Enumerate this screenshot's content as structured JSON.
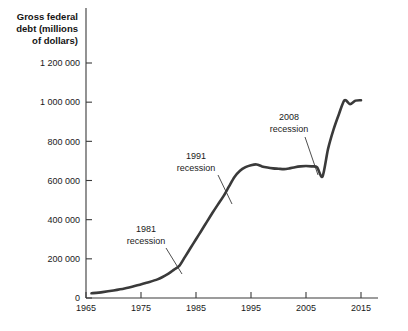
{
  "chart_data": {
    "type": "line",
    "title": "",
    "ylabel": "Gross federal debt (millions of dollars)",
    "ylabel_lines": [
      "Gross federal",
      "debt (millions",
      "of dollars)"
    ],
    "xlabel": "",
    "xlim": [
      1965,
      2015
    ],
    "ylim": [
      0,
      1300000
    ],
    "grid": false,
    "legend": null,
    "line_color": "#3a3a3a",
    "axis_color": "#3a3a3a",
    "background_color": "#ffffff",
    "y_ticks": [
      0,
      200000,
      400000,
      600000,
      800000,
      1000000,
      1200000
    ],
    "y_tick_labels": [
      "0",
      "200 000",
      "400 000",
      "600 000",
      "800 000",
      "1 000 000",
      "1 200 000"
    ],
    "x_ticks": [
      1965,
      1975,
      1985,
      1995,
      2005,
      2015
    ],
    "x_tick_labels": [
      "1965",
      "1975",
      "1985",
      "1995",
      "2005",
      "2015"
    ],
    "series": [
      {
        "name": "Gross federal debt",
        "x": [
          1966,
          1968,
          1970,
          1972,
          1974,
          1976,
          1978,
          1980,
          1981,
          1982,
          1983,
          1984,
          1985,
          1986,
          1987,
          1988,
          1989,
          1990,
          1991,
          1992,
          1993,
          1994,
          1995,
          1996,
          1997,
          1998,
          1999,
          2000,
          2001,
          2002,
          2003,
          2004,
          2005,
          2006,
          2007,
          2008,
          2009,
          2010,
          2011,
          2012,
          2013,
          2014,
          2015
        ],
        "values": [
          24000,
          30000,
          38000,
          48000,
          62000,
          78000,
          95000,
          125000,
          145000,
          165000,
          210000,
          255000,
          300000,
          345000,
          390000,
          435000,
          478000,
          520000,
          570000,
          618000,
          650000,
          668000,
          678000,
          682000,
          672000,
          666000,
          662000,
          660000,
          658000,
          662000,
          668000,
          672000,
          674000,
          672000,
          668000,
          620000,
          760000,
          860000,
          940000,
          1010000,
          990000,
          1008000,
          1010000
        ]
      }
    ],
    "annotations": [
      {
        "id": "recession-1981",
        "lines": [
          "1981",
          "recession"
        ],
        "label": "1981 recession",
        "year": 1981,
        "text_x": 146,
        "text_y": 232,
        "leader": {
          "x1": 166,
          "y1": 248,
          "x2": 182,
          "y2": 274
        }
      },
      {
        "id": "recession-1991",
        "lines": [
          "1991",
          "recession"
        ],
        "label": "1991 recession",
        "year": 1991,
        "text_x": 196,
        "text_y": 159,
        "leader": {
          "x1": 218,
          "y1": 175,
          "x2": 232,
          "y2": 204
        }
      },
      {
        "id": "recession-2008",
        "lines": [
          "2008",
          "recession"
        ],
        "label": "2008 recession",
        "year": 2008,
        "text_x": 289,
        "text_y": 120,
        "leader": {
          "x1": 305,
          "y1": 137,
          "x2": 318,
          "y2": 175
        }
      }
    ]
  }
}
